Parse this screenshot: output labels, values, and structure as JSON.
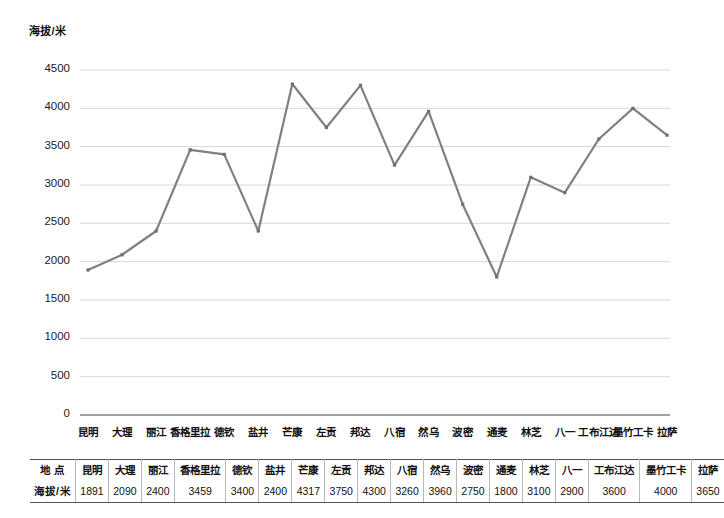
{
  "chart_data": {
    "type": "line",
    "title": "",
    "ylabel": "海拔/米",
    "xlabel": "",
    "ylim": [
      0,
      4500
    ],
    "ytick_step": 500,
    "yticks": [
      0,
      500,
      1000,
      1500,
      2000,
      2500,
      3000,
      3500,
      4000,
      4500
    ],
    "ytick_labels": [
      "0",
      "500",
      "1000",
      "1500",
      "2000",
      "2500",
      "3000",
      "3500",
      "4000",
      "4500"
    ],
    "grid": true,
    "legend": "none",
    "series_color": "#808080",
    "marker": "square",
    "categories": [
      "昆明",
      "大理",
      "丽江",
      "香格里拉",
      "德钦",
      "盐井",
      "芒康",
      "左贡",
      "邦达",
      "八宿",
      "然乌",
      "波密",
      "通麦",
      "林芝",
      "八一",
      "工布江达",
      "墨竹工卡",
      "拉萨"
    ],
    "values": [
      1891,
      2090,
      2400,
      3459,
      3400,
      2400,
      4317,
      3750,
      4300,
      3260,
      3960,
      2750,
      1800,
      3100,
      2900,
      3600,
      4000,
      3650
    ],
    "series": [
      {
        "name": "海拔/米",
        "values": [
          1891,
          2090,
          2400,
          3459,
          3400,
          2400,
          4317,
          3750,
          4300,
          3260,
          3960,
          2750,
          1800,
          3100,
          2900,
          3600,
          4000,
          3650
        ]
      }
    ]
  },
  "table": {
    "row_headers": [
      "地 点",
      "海拔/米"
    ],
    "columns": [
      "昆明",
      "大理",
      "丽江",
      "香格里拉",
      "德钦",
      "盐井",
      "芒康",
      "左贡",
      "邦达",
      "八宿",
      "然乌",
      "波密",
      "通麦",
      "林芝",
      "八一",
      "工布江达",
      "墨竹工卡",
      "拉萨"
    ],
    "values": [
      "1891",
      "2090",
      "2400",
      "3459",
      "3400",
      "2400",
      "4317",
      "3750",
      "4300",
      "3260",
      "3960",
      "2750",
      "1800",
      "3100",
      "2900",
      "3600",
      "4000",
      "3650"
    ]
  },
  "colors": {
    "line": "#808080",
    "grid": "#d6d6d6",
    "axis": "#808080",
    "text": "#111111"
  }
}
